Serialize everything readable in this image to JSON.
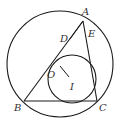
{
  "diagram": {
    "type": "geometry",
    "colors": {
      "stroke": "#1a1a1a",
      "label": "#333333",
      "background": "#ffffff"
    },
    "points": {
      "A": {
        "label": "A",
        "x": 83,
        "y": 21
      },
      "B": {
        "label": "B",
        "x": 24,
        "y": 101
      },
      "C": {
        "label": "C",
        "x": 97,
        "y": 101
      },
      "D": {
        "label": "D",
        "x": 70,
        "y": 39
      },
      "E": {
        "label": "E",
        "x": 84,
        "y": 34
      },
      "O": {
        "label": "O",
        "x": 53,
        "y": 64
      },
      "I": {
        "label": "I",
        "x": 69,
        "y": 80
      }
    },
    "label_positions": {
      "A": {
        "x": 82,
        "y": 15
      },
      "B": {
        "x": 14,
        "y": 111
      },
      "C": {
        "x": 99,
        "y": 111
      },
      "D": {
        "x": 60,
        "y": 42
      },
      "E": {
        "x": 88,
        "y": 37
      },
      "O": {
        "x": 47,
        "y": 78
      },
      "I": {
        "x": 70,
        "y": 90
      }
    },
    "circumcircle": {
      "cx": 60,
      "cy": 64,
      "r": 53
    },
    "incircle": {
      "cx": 72,
      "cy": 79,
      "r": 24
    },
    "segments": [
      [
        "A",
        "B"
      ],
      [
        "B",
        "C"
      ],
      [
        "C",
        "A"
      ],
      [
        "D",
        "A"
      ],
      [
        "D",
        "E"
      ]
    ],
    "oi_segment": {
      "x1": 60,
      "y1": 66,
      "x2": 69,
      "y2": 77
    }
  }
}
